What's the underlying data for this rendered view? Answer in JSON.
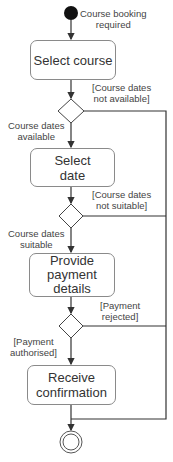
{
  "diagram": {
    "type": "UML activity diagram",
    "start_label": [
      "Course booking",
      "required"
    ],
    "activities": [
      {
        "id": "a1",
        "lines": [
          "Select course"
        ]
      },
      {
        "id": "a2",
        "lines": [
          "Select",
          "date"
        ]
      },
      {
        "id": "a3",
        "lines": [
          "Provide",
          "payment",
          "details"
        ]
      },
      {
        "id": "a4",
        "lines": [
          "Receive",
          "confirmation"
        ]
      }
    ],
    "decisions": [
      {
        "id": "d1",
        "yes": [
          "Course dates",
          "available"
        ],
        "no": [
          "[Course dates",
          "not available]"
        ]
      },
      {
        "id": "d2",
        "yes": [
          "Course dates",
          "suitable"
        ],
        "no": [
          "[Course dates",
          "not suitable]"
        ]
      },
      {
        "id": "d3",
        "yes": [
          "[Payment",
          "authorised]"
        ],
        "no": [
          "[Payment",
          "rejected]"
        ]
      }
    ],
    "colors": {
      "line": "#333333",
      "box_border": "#8a8a8a",
      "start_fill": "#111111"
    }
  }
}
